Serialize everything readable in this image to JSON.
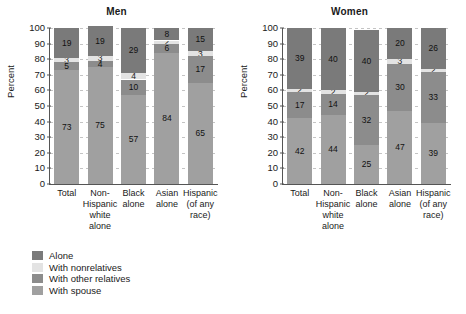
{
  "chart_data": [
    {
      "type": "bar",
      "title": "Men",
      "xlabel": "",
      "ylabel": "Percent",
      "ylim": [
        0,
        100
      ],
      "ytick_step": 10,
      "yticks": [
        100,
        90,
        80,
        70,
        60,
        50,
        40,
        30,
        20,
        10,
        0
      ],
      "grid": true,
      "stacked": true,
      "legend_position": "below",
      "categories": [
        "Total",
        "Non-Hispanic white alone",
        "Black alone",
        "Asian alone",
        "Hispanic (of any race)"
      ],
      "category_lines": [
        [
          "Total"
        ],
        [
          "Non-",
          "Hispanic",
          "white",
          "alone"
        ],
        [
          "Black",
          "alone"
        ],
        [
          "Asian",
          "alone"
        ],
        [
          "Hispanic",
          "(of any",
          "race)"
        ]
      ],
      "series": [
        {
          "name": "With spouse",
          "color": "#a0a0a0",
          "values": [
            73,
            75,
            57,
            84,
            65
          ]
        },
        {
          "name": "With other relatives",
          "color": "#8c8c8c",
          "values": [
            5,
            4,
            10,
            6,
            17
          ]
        },
        {
          "name": "With nonrelatives",
          "color": "#e3e3e3",
          "values": [
            3,
            3,
            4,
            2,
            3
          ]
        },
        {
          "name": "Alone",
          "color": "#7a7a7a",
          "values": [
            19,
            19,
            29,
            8,
            15
          ]
        }
      ]
    },
    {
      "type": "bar",
      "title": "Women",
      "xlabel": "",
      "ylabel": "Percent",
      "ylim": [
        0,
        100
      ],
      "ytick_step": 10,
      "yticks": [
        100,
        90,
        80,
        70,
        60,
        50,
        40,
        30,
        20,
        10,
        0
      ],
      "grid": true,
      "stacked": true,
      "legend_position": "below",
      "categories": [
        "Total",
        "Non-Hispanic white alone",
        "Black alone",
        "Asian alone",
        "Hispanic (of any race)"
      ],
      "category_lines": [
        [
          "Total"
        ],
        [
          "Non-",
          "Hispanic",
          "white",
          "alone"
        ],
        [
          "Black",
          "alone"
        ],
        [
          "Asian",
          "alone"
        ],
        [
          "Hispanic",
          "(of any",
          "race)"
        ]
      ],
      "series": [
        {
          "name": "With spouse",
          "color": "#a0a0a0",
          "values": [
            42,
            44,
            25,
            47,
            39
          ]
        },
        {
          "name": "With other relatives",
          "color": "#8c8c8c",
          "values": [
            17,
            14,
            32,
            30,
            33
          ]
        },
        {
          "name": "With nonrelatives",
          "color": "#e3e3e3",
          "values": [
            2,
            2,
            2,
            3,
            2
          ]
        },
        {
          "name": "Alone",
          "color": "#7a7a7a",
          "values": [
            39,
            40,
            40,
            20,
            26
          ]
        }
      ]
    }
  ],
  "legend": {
    "items": [
      {
        "label": "Alone",
        "color": "#7a7a7a"
      },
      {
        "label": "With nonrelatives",
        "color": "#e3e3e3"
      },
      {
        "label": "With other relatives",
        "color": "#8c8c8c"
      },
      {
        "label": "With spouse",
        "color": "#a0a0a0"
      }
    ]
  }
}
